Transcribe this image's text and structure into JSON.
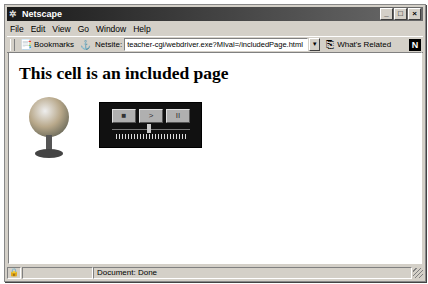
{
  "window": {
    "title": "Netscape",
    "controls": {
      "minimize": "_",
      "maximize": "□",
      "close": "×"
    }
  },
  "menu": {
    "items": [
      "File",
      "Edit",
      "View",
      "Go",
      "Window",
      "Help"
    ]
  },
  "toolbar": {
    "bookmarks_label": "Bookmarks",
    "netsite_label": "Netsite:",
    "url": "teacher-cgi/webdriver.exe?MIval=/includedPage.html",
    "whats_related_label": "What's Related",
    "logo": "N"
  },
  "content": {
    "heading": "This cell is an included page",
    "player": {
      "stop": "■",
      "play": ">",
      "pause": "II"
    }
  },
  "status": {
    "text": "Document: Done"
  }
}
